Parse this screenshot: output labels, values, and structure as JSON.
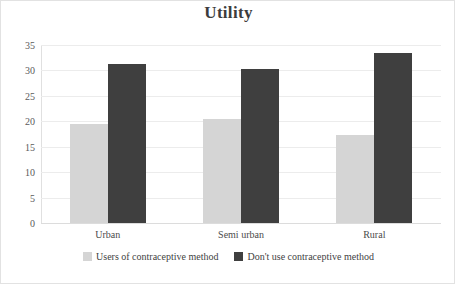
{
  "chart_data": {
    "type": "bar",
    "title": "Utility",
    "xlabel": "",
    "ylabel": "",
    "categories": [
      "Urban",
      "Semi urban",
      "Rural"
    ],
    "series": [
      {
        "name": "Users of  contraceptive method",
        "color": "#d5d5d5",
        "values": [
          19.4,
          20.4,
          17.4
        ]
      },
      {
        "name": "Don't use contraceptive method",
        "color": "#3f3f3f",
        "values": [
          31.2,
          30.2,
          33.4
        ]
      }
    ],
    "ylim": [
      0,
      35
    ],
    "yticks": [
      0,
      5,
      10,
      15,
      20,
      25,
      30,
      35
    ],
    "ytick_labels": [
      "0",
      "5",
      "10",
      "15",
      "20",
      "25",
      "30",
      "35"
    ],
    "grid": true,
    "legend_position": "bottom"
  },
  "legend": {
    "items": [
      {
        "label": "Users of  contraceptive method",
        "swatch": "light-gray-swatch"
      },
      {
        "label": "Don't use contraceptive method",
        "swatch": "dark-gray-swatch"
      }
    ]
  }
}
